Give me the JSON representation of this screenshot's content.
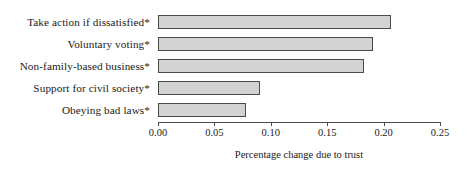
{
  "chart_data": {
    "type": "bar",
    "orientation": "horizontal",
    "title": "",
    "xlabel": "Percentage change due to trust",
    "ylabel": "",
    "xlim": [
      0.0,
      0.25
    ],
    "grid": false,
    "legend": null,
    "xticks": [
      "0.00",
      "0.05",
      "0.10",
      "0.15",
      "0.20",
      "0.25"
    ],
    "xtick_values": [
      0.0,
      0.05,
      0.1,
      0.15,
      0.2,
      0.25
    ],
    "categories": [
      "Take action if dissatisfied*",
      "Voluntary voting*",
      "Non-family-based business*",
      "Support for civil society*",
      "Obeying bad laws*"
    ],
    "values": [
      0.207,
      0.191,
      0.183,
      0.09,
      0.078
    ],
    "bar_fill_color": "#d2d2d2",
    "bar_border_color": "#4a4a4a",
    "note": "* denotes statistical significance"
  }
}
